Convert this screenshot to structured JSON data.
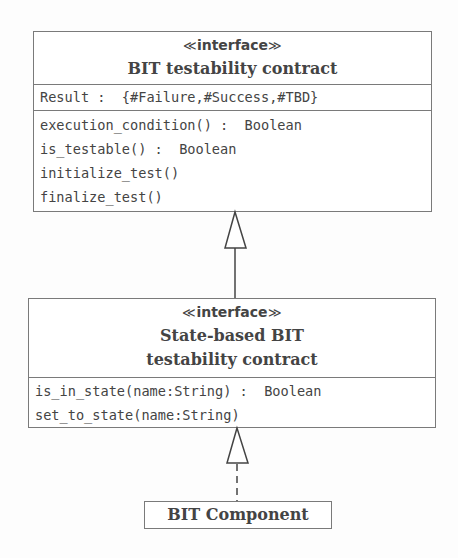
{
  "diagram": {
    "type": "UML class diagram",
    "classes": [
      {
        "id": "bit-testability-contract",
        "stereotype": "interface",
        "stereo_open": "≪",
        "stereo_close": "≫",
        "name_lines": [
          "BIT testability contract"
        ],
        "attributes": [
          "Result :  {#Failure,#Success,#TBD}"
        ],
        "operations": [
          "execution_condition() :  Boolean",
          "is_testable() :  Boolean",
          "initialize_test()",
          "finalize_test()"
        ]
      },
      {
        "id": "state-based-bit-testability-contract",
        "stereotype": "interface",
        "stereo_open": "≪",
        "stereo_close": "≫",
        "name_lines": [
          "State-based BIT",
          "testability contract"
        ],
        "operations": [
          "is_in_state(name:String) :  Boolean",
          "set_to_state(name:String)"
        ]
      },
      {
        "id": "bit-component",
        "name_lines": [
          "BIT Component"
        ]
      }
    ],
    "relations": [
      {
        "from": "state-based-bit-testability-contract",
        "to": "bit-testability-contract",
        "kind": "generalization",
        "line": "solid"
      },
      {
        "from": "bit-component",
        "to": "state-based-bit-testability-contract",
        "kind": "realization",
        "line": "dashed"
      }
    ]
  }
}
